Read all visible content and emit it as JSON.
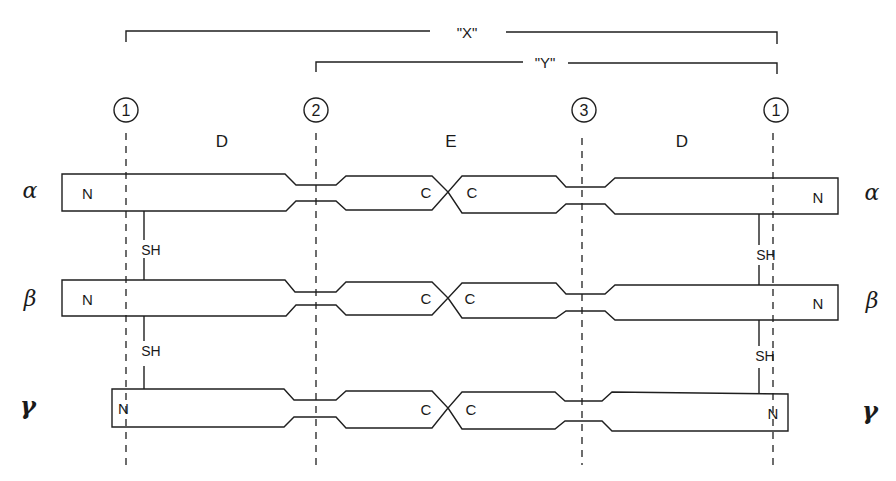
{
  "diagram": {
    "type": "fibrinogen-like molecular schematic",
    "brackets": [
      {
        "id": "X",
        "label": "\"X\"",
        "x_start": 126,
        "x_end": 777,
        "y": 32,
        "label_x": 467
      },
      {
        "id": "Y",
        "label": "\"Y\"",
        "x_start": 316,
        "x_end": 777,
        "y": 62,
        "label_x": 543
      }
    ],
    "cleavage_sites": [
      {
        "label": "1",
        "x": 126
      },
      {
        "label": "2",
        "x": 316
      },
      {
        "label": "3",
        "x": 582
      },
      {
        "label": "1",
        "x": 773
      }
    ],
    "domains": [
      {
        "label": "D",
        "x": 222
      },
      {
        "label": "E",
        "x": 450
      },
      {
        "label": "D",
        "x": 682
      }
    ],
    "chains": [
      {
        "name": "α",
        "symbol": "alpha",
        "y_center": 192,
        "left_terminal": "N",
        "left_center_terminal": "C",
        "right_center_terminal": "C",
        "right_terminal": "N",
        "left_x": 62,
        "right_x": 838
      },
      {
        "name": "β",
        "symbol": "beta",
        "y_center": 298,
        "left_terminal": "N",
        "left_center_terminal": "C",
        "right_center_terminal": "C",
        "right_terminal": "N",
        "left_x": 62,
        "right_x": 838
      },
      {
        "name": "γ",
        "symbol": "gamma",
        "y_center": 408,
        "left_terminal": "N",
        "left_center_terminal": "C",
        "right_center_terminal": "C",
        "right_terminal": "N",
        "left_x": 112,
        "right_x": 788
      }
    ],
    "disulfide_links": [
      {
        "label": "SH",
        "x": 144,
        "between": [
          "α",
          "β"
        ]
      },
      {
        "label": "SH",
        "x": 144,
        "between": [
          "β",
          "γ"
        ]
      },
      {
        "label": "SH",
        "x": 759,
        "between": [
          "α",
          "β"
        ]
      },
      {
        "label": "SH",
        "x": 759,
        "between": [
          "β",
          "γ"
        ]
      }
    ],
    "colors": {
      "ink": "#1f1f1f",
      "background": "#ffffff"
    }
  },
  "labels": {
    "bracket_x": "\"X\"",
    "bracket_y": "\"Y\"",
    "site_1": "1",
    "site_2": "2",
    "site_3": "3",
    "domain_d": "D",
    "domain_e": "E",
    "n_term": "N",
    "c_term": "C",
    "sh": "SH",
    "alpha": "α",
    "beta": "β",
    "gamma": "γ"
  }
}
